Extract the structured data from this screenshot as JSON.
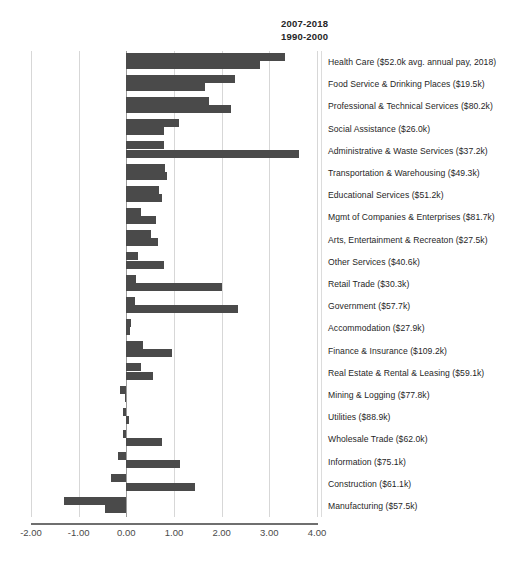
{
  "chart_data": {
    "type": "bar",
    "orientation": "horizontal",
    "title": "",
    "subtitle": "",
    "xlabel": "",
    "ylabel": "",
    "xlim": [
      -2.0,
      4.0
    ],
    "xticks": [
      "-2.00",
      "-1.00",
      "0.00",
      "1.00",
      "2.00",
      "3.00",
      "4.00"
    ],
    "xtick_values": [
      -2.0,
      -1.0,
      0.0,
      1.0,
      2.0,
      3.0,
      4.0
    ],
    "grid": true,
    "legend_position": "top-right",
    "bar_color": "#4a4a4a",
    "series": [
      {
        "name": "2007-2018",
        "values": [
          3.33,
          2.28,
          1.73,
          1.1,
          0.8,
          0.82,
          0.68,
          0.3,
          0.52,
          0.24,
          0.2,
          0.18,
          0.1,
          0.36,
          0.3,
          -0.13,
          -0.08,
          -0.06,
          -0.18,
          -0.33,
          -1.3
        ]
      },
      {
        "name": "1990-2000",
        "values": [
          2.8,
          1.65,
          2.2,
          0.8,
          3.63,
          0.85,
          0.74,
          0.62,
          0.67,
          0.78,
          2.0,
          2.35,
          0.08,
          0.95,
          0.57,
          -0.02,
          0.06,
          0.75,
          1.12,
          1.45,
          -0.44
        ]
      }
    ],
    "categories": [
      "Health Care ($52.0k avg. annual pay, 2018)",
      "Food Service & Drinking Places ($19.5k)",
      "Professional & Technical Services ($80.2k)",
      "Social Assistance ($26.0k)",
      "Administrative & Waste Services ($37.2k)",
      "Transportation & Warehousing ($49.3k)",
      "Educational Services ($51.2k)",
      "Mgmt of Companies & Enterprises ($81.7k)",
      "Arts, Entertainment & Recreaton ($27.5k)",
      "Other Services ($40.6k)",
      "Retail Trade ($30.3k)",
      "Government ($57.7k)",
      "Accommodation ($27.9k)",
      "Finance & Insurance ($109.2k)",
      "Real Estate & Rental & Leasing ($59.1k)",
      "Mining & Logging ($77.8k)",
      "Utilities ($88.9k)",
      "Wholesale Trade ($62.0k)",
      "Information ($75.1k)",
      "Construction ($61.1k)",
      "Manufacturing ($57.5k)"
    ]
  },
  "legend": {
    "line1": "2007-2018",
    "line2": "1990-2000"
  }
}
